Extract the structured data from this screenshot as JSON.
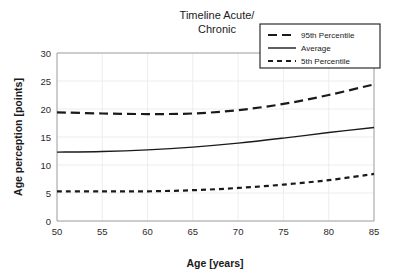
{
  "chart_data": {
    "type": "line",
    "title": "Timeline Acute/ Chronic",
    "title_line1": "Timeline Acute/",
    "title_line2": "Chronic",
    "xlabel": "Age [years]",
    "ylabel": "Age perception [points]",
    "xlim": [
      50,
      85
    ],
    "ylim": [
      0,
      30
    ],
    "xticks": [
      50,
      55,
      60,
      65,
      70,
      75,
      80,
      85
    ],
    "yticks": [
      0,
      5,
      10,
      15,
      20,
      25,
      30
    ],
    "xtick_labels": [
      "50",
      "55",
      "60",
      "65",
      "70",
      "75",
      "80",
      "85"
    ],
    "ytick_labels": [
      "0",
      "5",
      "10",
      "15",
      "20",
      "25",
      "30"
    ],
    "grid": "both",
    "legend_position": "top-right",
    "x": [
      50,
      55,
      60,
      65,
      70,
      75,
      80,
      85
    ],
    "series": [
      {
        "name": "95th Percentile",
        "style": "long-dashed",
        "color": "#1a1a1a",
        "values": [
          19.4,
          19.2,
          19.1,
          19.2,
          19.8,
          20.9,
          22.5,
          24.4
        ]
      },
      {
        "name": "Average",
        "style": "solid",
        "color": "#1a1a1a",
        "values": [
          12.3,
          12.4,
          12.7,
          13.2,
          13.9,
          14.8,
          15.8,
          16.7
        ]
      },
      {
        "name": "5th Percentile",
        "style": "short-dashed",
        "color": "#1a1a1a",
        "values": [
          5.3,
          5.3,
          5.3,
          5.5,
          5.9,
          6.5,
          7.3,
          8.4
        ]
      }
    ],
    "legend": [
      {
        "label": "95th Percentile",
        "style": "long-dashed"
      },
      {
        "label": "Average",
        "style": "solid"
      },
      {
        "label": "5th Percentile",
        "style": "short-dashed"
      }
    ]
  }
}
